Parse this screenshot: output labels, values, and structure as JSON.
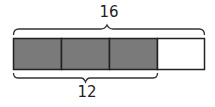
{
  "diagram": {
    "type": "tape-diagram",
    "total_label": "16",
    "part_label": "12",
    "segments": [
      {
        "filled": true
      },
      {
        "filled": true
      },
      {
        "filled": true
      },
      {
        "filled": false
      }
    ],
    "colors": {
      "filled": "#7a7a7a",
      "empty": "#ffffff",
      "stroke": "#222222"
    }
  }
}
